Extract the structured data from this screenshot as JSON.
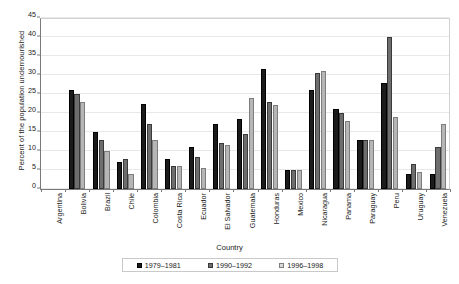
{
  "chart_data": {
    "type": "bar",
    "title": "",
    "xlabel": "Country",
    "ylabel": "Percent of the population undernourished",
    "ylim": [
      0,
      45
    ],
    "yticks": [
      0,
      5,
      10,
      15,
      20,
      25,
      30,
      35,
      40,
      45
    ],
    "grid": true,
    "legend_position": "bottom",
    "categories": [
      "Argentina",
      "Bolivia",
      "Brazil",
      "Chile",
      "Colombia",
      "Costa Rica",
      "Ecuador",
      "El Salvador",
      "Guatemala",
      "Honduras",
      "Mexico",
      "Nicaragua",
      "Panama",
      "Paraguay",
      "Peru",
      "Uruguay",
      "Venezuela"
    ],
    "series": [
      {
        "name": "1979–1981",
        "color": "#1b1b1b",
        "values": [
          0,
          26,
          15,
          7,
          22.5,
          8,
          11,
          17,
          18.5,
          31.5,
          5,
          26,
          21,
          13,
          28,
          4,
          4
        ]
      },
      {
        "name": "1990–1992",
        "color": "#6e6e6e",
        "values": [
          0,
          25,
          13,
          8,
          17,
          6,
          8.5,
          12,
          14.5,
          23,
          5,
          30.5,
          20,
          13,
          40,
          6.5,
          11
        ]
      },
      {
        "name": "1996–1998",
        "color": "#b6b6b6",
        "values": [
          0,
          23,
          10,
          4,
          13,
          6,
          5.5,
          11.5,
          24,
          22,
          5,
          31,
          18,
          13,
          19,
          4.5,
          17
        ]
      }
    ]
  },
  "legend": {
    "items": [
      {
        "label": "1979–1981"
      },
      {
        "label": "1990–1992"
      },
      {
        "label": "1996–1998"
      }
    ]
  }
}
